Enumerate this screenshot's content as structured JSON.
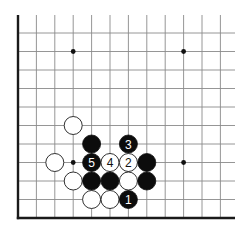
{
  "diagram": {
    "type": "go-board-partial",
    "view": "lower-left corner",
    "grid": {
      "columns": 12,
      "rows": 11,
      "origin_x": 18,
      "origin_y": 218,
      "spacing_x": 18.4,
      "spacing_y": 18.5,
      "overhang_right": 235,
      "overhang_top": 15
    },
    "edges": [
      "left",
      "bottom"
    ],
    "star_points": [
      {
        "col": 3,
        "row": 9
      },
      {
        "col": 9,
        "row": 9
      },
      {
        "col": 3,
        "row": 3
      },
      {
        "col": 9,
        "row": 3
      }
    ],
    "stones": [
      {
        "color": "white",
        "col": 3,
        "row": 5,
        "label": ""
      },
      {
        "color": "black",
        "col": 4,
        "row": 4,
        "label": ""
      },
      {
        "color": "black",
        "col": 6,
        "row": 4,
        "label": "3"
      },
      {
        "color": "white",
        "col": 2,
        "row": 3,
        "label": ""
      },
      {
        "color": "black",
        "col": 4,
        "row": 3,
        "label": "5"
      },
      {
        "color": "white",
        "col": 5,
        "row": 3,
        "label": "4"
      },
      {
        "color": "white",
        "col": 6,
        "row": 3,
        "label": "2"
      },
      {
        "color": "black",
        "col": 7,
        "row": 3,
        "label": ""
      },
      {
        "color": "white",
        "col": 3,
        "row": 2,
        "label": ""
      },
      {
        "color": "black",
        "col": 4,
        "row": 2,
        "label": ""
      },
      {
        "color": "black",
        "col": 5,
        "row": 2,
        "label": ""
      },
      {
        "color": "white",
        "col": 6,
        "row": 2,
        "label": ""
      },
      {
        "color": "black",
        "col": 7,
        "row": 2,
        "label": ""
      },
      {
        "color": "white",
        "col": 4,
        "row": 1,
        "label": ""
      },
      {
        "color": "white",
        "col": 5,
        "row": 1,
        "label": ""
      },
      {
        "color": "black",
        "col": 6,
        "row": 1,
        "label": "1"
      }
    ],
    "colors": {
      "background": "#ffffff",
      "grid": "#8a8a8a",
      "edge": "#1a1a1a",
      "black_stone": "#0c0c0c",
      "white_stone": "#ffffff"
    }
  }
}
